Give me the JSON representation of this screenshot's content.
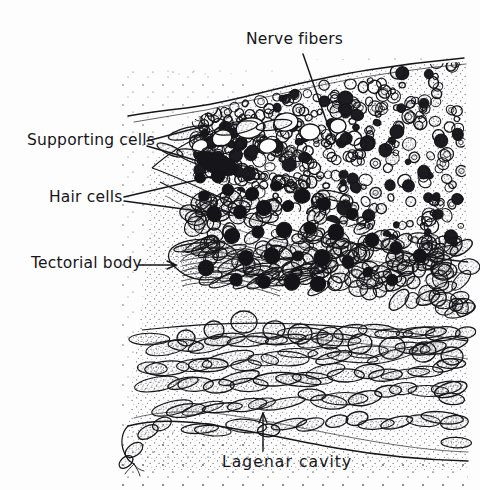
{
  "figure": {
    "type": "line-drawing-micrograph",
    "width": 480,
    "height": 490,
    "background_color": "#fdfdfd",
    "ink_color": "#16161a"
  },
  "labels": [
    {
      "id": "nerve-fibers",
      "text": "Nerve fibers",
      "x": 246,
      "y": 32,
      "leader": "line",
      "points_to": "upper-right cell mass"
    },
    {
      "id": "supporting-cells",
      "text": "Supporting cells",
      "x": 27,
      "y": 133,
      "leader": "line",
      "points_to": "elongate pale cells at left apex"
    },
    {
      "id": "hair-cells",
      "text": "Hair cells",
      "x": 49,
      "y": 190,
      "leader": "line",
      "points_to": "dark round nuclei in central band"
    },
    {
      "id": "tectorial-body",
      "text": "Tectorial body",
      "x": 31,
      "y": 256,
      "leader": "arrow",
      "points_to": "stippled body at left tip of sensory ridge"
    },
    {
      "id": "lagenar-cavity",
      "text": "Lagenar cavity",
      "x": 222,
      "y": 455,
      "leader": "arrow-up",
      "points_to": "open space below basal membrane"
    }
  ],
  "regions": [
    {
      "id": "nerve-fiber-bundle",
      "description": "dense mass of small circular profiles, upper right"
    },
    {
      "id": "sensory-epithelium",
      "description": "central band of columnar cells with dark nuclei"
    },
    {
      "id": "supporting-cell-band",
      "description": "elongate stippled cells forming the left apex"
    },
    {
      "id": "basal-cell-layer",
      "description": "rows of elongate stippled cells, lower half"
    },
    {
      "id": "lagenar-lumen",
      "description": "stippled open cavity, bottom left"
    }
  ]
}
